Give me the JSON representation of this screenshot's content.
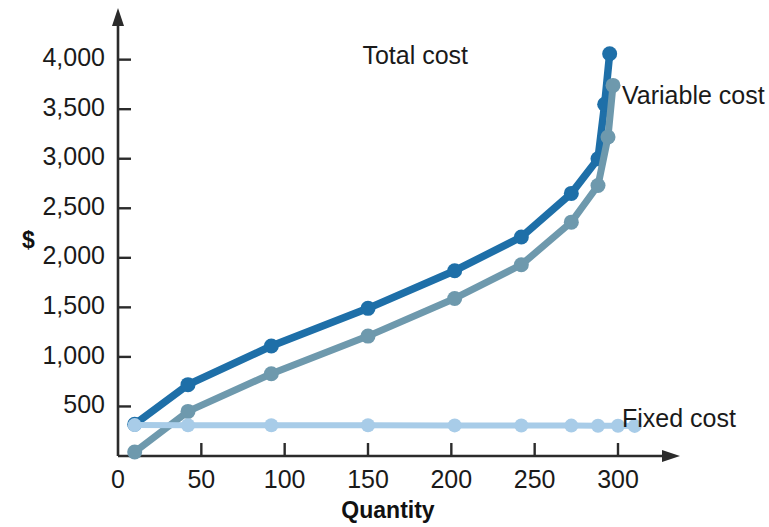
{
  "chart_data": {
    "type": "line",
    "title": "",
    "xlabel": "Quantity",
    "ylabel": "$",
    "xlim": [
      0,
      330
    ],
    "ylim": [
      0,
      4400
    ],
    "grid": false,
    "legend_position": "inline-right-of-series-end",
    "x_ticks": [
      0,
      50,
      100,
      150,
      200,
      250,
      300
    ],
    "x_tick_labels": [
      "0",
      "50",
      "100",
      "150",
      "200",
      "250",
      "300"
    ],
    "y_ticks": [
      500,
      1000,
      1500,
      2000,
      2500,
      3000,
      3500,
      4000
    ],
    "y_tick_labels": [
      "500",
      "1,000",
      "1,500",
      "2,000",
      "2,500",
      "3,000",
      "3,500",
      "4,000"
    ],
    "series": [
      {
        "name": "Total cost",
        "color": "#1e6fa8",
        "label_text": "Total cost",
        "points": [
          {
            "x": 10,
            "y": 320
          },
          {
            "x": 42,
            "y": 720
          },
          {
            "x": 92,
            "y": 1110
          },
          {
            "x": 150,
            "y": 1490
          },
          {
            "x": 202,
            "y": 1870
          },
          {
            "x": 242,
            "y": 2210
          },
          {
            "x": 272,
            "y": 2650
          },
          {
            "x": 288,
            "y": 3000
          },
          {
            "x": 292,
            "y": 3550
          },
          {
            "x": 295,
            "y": 4060
          }
        ]
      },
      {
        "name": "Variable cost",
        "color": "#6e99ad",
        "label_text": "Variable cost",
        "points": [
          {
            "x": 10,
            "y": 40
          },
          {
            "x": 42,
            "y": 450
          },
          {
            "x": 92,
            "y": 830
          },
          {
            "x": 150,
            "y": 1210
          },
          {
            "x": 202,
            "y": 1590
          },
          {
            "x": 242,
            "y": 1930
          },
          {
            "x": 272,
            "y": 2360
          },
          {
            "x": 288,
            "y": 2730
          },
          {
            "x": 294,
            "y": 3220
          },
          {
            "x": 297,
            "y": 3740
          }
        ]
      },
      {
        "name": "Fixed cost",
        "color": "#a8cce8",
        "label_text": "Fixed cost",
        "points": [
          {
            "x": 10,
            "y": 312
          },
          {
            "x": 42,
            "y": 311
          },
          {
            "x": 92,
            "y": 310
          },
          {
            "x": 150,
            "y": 310
          },
          {
            "x": 202,
            "y": 309
          },
          {
            "x": 242,
            "y": 308
          },
          {
            "x": 272,
            "y": 307
          },
          {
            "x": 288,
            "y": 306
          },
          {
            "x": 300,
            "y": 305
          },
          {
            "x": 310,
            "y": 304
          }
        ]
      }
    ]
  },
  "labels": {
    "total_cost": "Total cost",
    "variable_cost": "Variable cost",
    "fixed_cost": "Fixed cost",
    "x_axis_title": "Quantity",
    "y_axis_title": "$"
  }
}
